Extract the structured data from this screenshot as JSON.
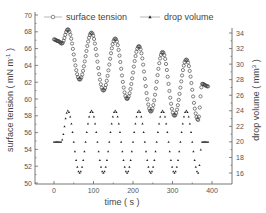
{
  "chart_data": {
    "type": "line",
    "title": "",
    "xlabel": "time ( s )",
    "ylabel": "surface tension ( mN m-1 )",
    "y2label": "drop volume ( mm3 )",
    "xlim": [
      -30,
      430
    ],
    "ylim": [
      50,
      70
    ],
    "y2lim": [
      14.5,
      35
    ],
    "x_ticks": [
      0,
      100,
      200,
      300,
      400
    ],
    "y_ticks": [
      50,
      52,
      54,
      56,
      58,
      60,
      62,
      64,
      66,
      68,
      70
    ],
    "y2_ticks": [
      16,
      18,
      20,
      22,
      24,
      26,
      28,
      30,
      32,
      34
    ],
    "grid": false,
    "legend_position": "top",
    "series": [
      {
        "name": "surface tension",
        "axis": "left",
        "marker": "open-circle",
        "key_points": {
          "t": [
            0,
            10,
            20,
            35,
            65,
            95,
            125,
            155,
            185,
            215,
            245,
            275,
            305,
            335,
            365,
            375,
            390
          ],
          "value": [
            67.1,
            66.9,
            66.6,
            68.3,
            62.3,
            67.9,
            61.0,
            67.2,
            60.0,
            66.3,
            58.5,
            65.6,
            58.0,
            64.7,
            57.5,
            61.8,
            61.5
          ]
        }
      },
      {
        "name": "drop volume",
        "axis": "right",
        "marker": "filled-triangle",
        "key_points": {
          "t": [
            0,
            18,
            35,
            65,
            95,
            125,
            155,
            185,
            215,
            245,
            275,
            305,
            335,
            365,
            375,
            390
          ],
          "value": [
            20,
            20,
            24,
            16,
            24,
            16,
            24,
            16,
            24,
            16,
            24,
            16,
            24,
            16,
            20,
            20
          ]
        },
        "flat_value": 20,
        "amplitude": 4,
        "period_s": 60
      }
    ]
  },
  "legend": {
    "surface_tension": "surface tension",
    "drop_volume": "drop volume"
  },
  "axes": {
    "x_title": "time ( s )",
    "y_left_title": "surface tension ( mN m",
    "y_left_sup": "-1",
    "y_right_title": "drop volume ( mm",
    "y_right_sup": "3",
    "x_tick_labels": [
      "0",
      "100",
      "200",
      "300",
      "400"
    ],
    "y_left_tick_labels": [
      "50",
      "52",
      "54",
      "56",
      "58",
      "60",
      "62",
      "64",
      "66",
      "68",
      "70"
    ],
    "y_right_tick_labels": [
      "16",
      "18",
      "20",
      "22",
      "24",
      "26",
      "28",
      "30",
      "32",
      "34"
    ]
  },
  "colors": {
    "axis": "#555555",
    "series": "#222222",
    "text": "#444444"
  }
}
